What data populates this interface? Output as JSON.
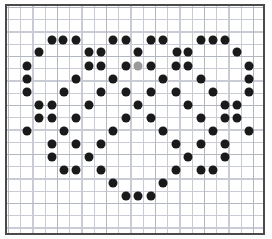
{
  "figure": {
    "title": "",
    "background_color": "#ffffff",
    "frame_color": "#4a4a4a",
    "grid_minor_color": "#c9ccd4",
    "grid_major_color": "#b3b7c0",
    "grid_spacing_px": 12.25,
    "grid_major_every": 4,
    "plot_origin": {
      "x": 5,
      "y": 4
    },
    "plot_size": {
      "width": 260,
      "height": 231
    }
  },
  "chart_data": {
    "type": "scatter",
    "title": "",
    "xlabel": "",
    "ylabel": "",
    "xlim": [
      0,
      272
    ],
    "ylim": [
      239,
      0
    ],
    "grid": true,
    "legend": null,
    "marker": "circle",
    "marker_size_px": 9,
    "colors": {
      "default": "#1a1a1a",
      "highlight": "#9a9a9a"
    },
    "annotations": [
      {
        "text": "single light-gray marker near plot center",
        "x": 138.3,
        "y": 66
      }
    ],
    "series": [
      {
        "name": "markers",
        "color": "#1a1a1a",
        "points": [
          {
            "x": 51.7,
            "y": 40,
            "c": "#1a1a1a"
          },
          {
            "x": 63.3,
            "y": 40,
            "c": "#1a1a1a"
          },
          {
            "x": 76.0,
            "y": 40,
            "c": "#1a1a1a"
          },
          {
            "x": 113.3,
            "y": 40,
            "c": "#1a1a1a"
          },
          {
            "x": 126.0,
            "y": 40,
            "c": "#1a1a1a"
          },
          {
            "x": 150.7,
            "y": 40,
            "c": "#1a1a1a"
          },
          {
            "x": 162.7,
            "y": 40,
            "c": "#1a1a1a"
          },
          {
            "x": 201.0,
            "y": 40,
            "c": "#1a1a1a"
          },
          {
            "x": 213.3,
            "y": 40,
            "c": "#1a1a1a"
          },
          {
            "x": 225.3,
            "y": 40,
            "c": "#1a1a1a"
          },
          {
            "x": 39.3,
            "y": 52,
            "c": "#1a1a1a"
          },
          {
            "x": 89.3,
            "y": 52,
            "c": "#1a1a1a"
          },
          {
            "x": 100.7,
            "y": 52,
            "c": "#1a1a1a"
          },
          {
            "x": 138.3,
            "y": 52,
            "c": "#1a1a1a"
          },
          {
            "x": 176.7,
            "y": 52,
            "c": "#1a1a1a"
          },
          {
            "x": 188.3,
            "y": 52,
            "c": "#1a1a1a"
          },
          {
            "x": 237.3,
            "y": 52,
            "c": "#1a1a1a"
          },
          {
            "x": 27.3,
            "y": 66,
            "c": "#1a1a1a"
          },
          {
            "x": 89.0,
            "y": 66,
            "c": "#1a1a1a"
          },
          {
            "x": 100.7,
            "y": 66,
            "c": "#1a1a1a"
          },
          {
            "x": 126.0,
            "y": 66,
            "c": "#1a1a1a"
          },
          {
            "x": 138.3,
            "y": 66,
            "c": "#9a9a9a"
          },
          {
            "x": 150.7,
            "y": 66,
            "c": "#1a1a1a"
          },
          {
            "x": 176.0,
            "y": 66,
            "c": "#1a1a1a"
          },
          {
            "x": 188.3,
            "y": 66,
            "c": "#1a1a1a"
          },
          {
            "x": 249.3,
            "y": 66,
            "c": "#1a1a1a"
          },
          {
            "x": 26.7,
            "y": 79,
            "c": "#1a1a1a"
          },
          {
            "x": 76.0,
            "y": 79,
            "c": "#1a1a1a"
          },
          {
            "x": 113.3,
            "y": 79,
            "c": "#1a1a1a"
          },
          {
            "x": 163.3,
            "y": 79,
            "c": "#1a1a1a"
          },
          {
            "x": 201.0,
            "y": 79,
            "c": "#1a1a1a"
          },
          {
            "x": 249.3,
            "y": 79,
            "c": "#1a1a1a"
          },
          {
            "x": 27.3,
            "y": 92,
            "c": "#1a1a1a"
          },
          {
            "x": 64.0,
            "y": 92,
            "c": "#1a1a1a"
          },
          {
            "x": 100.7,
            "y": 92,
            "c": "#1a1a1a"
          },
          {
            "x": 126.0,
            "y": 92,
            "c": "#1a1a1a"
          },
          {
            "x": 150.7,
            "y": 92,
            "c": "#1a1a1a"
          },
          {
            "x": 176.0,
            "y": 92,
            "c": "#1a1a1a"
          },
          {
            "x": 213.3,
            "y": 92,
            "c": "#1a1a1a"
          },
          {
            "x": 249.3,
            "y": 92,
            "c": "#1a1a1a"
          },
          {
            "x": 39.3,
            "y": 105,
            "c": "#1a1a1a"
          },
          {
            "x": 51.7,
            "y": 105,
            "c": "#1a1a1a"
          },
          {
            "x": 89.0,
            "y": 105,
            "c": "#1a1a1a"
          },
          {
            "x": 138.3,
            "y": 105,
            "c": "#1a1a1a"
          },
          {
            "x": 188.3,
            "y": 105,
            "c": "#1a1a1a"
          },
          {
            "x": 225.0,
            "y": 105,
            "c": "#1a1a1a"
          },
          {
            "x": 237.3,
            "y": 105,
            "c": "#1a1a1a"
          },
          {
            "x": 39.3,
            "y": 118,
            "c": "#1a1a1a"
          },
          {
            "x": 51.7,
            "y": 118,
            "c": "#1a1a1a"
          },
          {
            "x": 76.0,
            "y": 118,
            "c": "#1a1a1a"
          },
          {
            "x": 126.0,
            "y": 118,
            "c": "#1a1a1a"
          },
          {
            "x": 150.7,
            "y": 118,
            "c": "#1a1a1a"
          },
          {
            "x": 201.0,
            "y": 118,
            "c": "#1a1a1a"
          },
          {
            "x": 225.0,
            "y": 118,
            "c": "#1a1a1a"
          },
          {
            "x": 237.3,
            "y": 118,
            "c": "#1a1a1a"
          },
          {
            "x": 27.3,
            "y": 131,
            "c": "#1a1a1a"
          },
          {
            "x": 64.0,
            "y": 131,
            "c": "#1a1a1a"
          },
          {
            "x": 113.3,
            "y": 131,
            "c": "#1a1a1a"
          },
          {
            "x": 163.3,
            "y": 131,
            "c": "#1a1a1a"
          },
          {
            "x": 213.3,
            "y": 131,
            "c": "#1a1a1a"
          },
          {
            "x": 249.3,
            "y": 131,
            "c": "#1a1a1a"
          },
          {
            "x": 51.7,
            "y": 144,
            "c": "#1a1a1a"
          },
          {
            "x": 76.0,
            "y": 144,
            "c": "#1a1a1a"
          },
          {
            "x": 100.7,
            "y": 144,
            "c": "#1a1a1a"
          },
          {
            "x": 176.0,
            "y": 144,
            "c": "#1a1a1a"
          },
          {
            "x": 201.0,
            "y": 144,
            "c": "#1a1a1a"
          },
          {
            "x": 225.0,
            "y": 144,
            "c": "#1a1a1a"
          },
          {
            "x": 51.7,
            "y": 157,
            "c": "#1a1a1a"
          },
          {
            "x": 89.0,
            "y": 157,
            "c": "#1a1a1a"
          },
          {
            "x": 188.3,
            "y": 157,
            "c": "#1a1a1a"
          },
          {
            "x": 225.0,
            "y": 157,
            "c": "#1a1a1a"
          },
          {
            "x": 64.0,
            "y": 170,
            "c": "#1a1a1a"
          },
          {
            "x": 76.0,
            "y": 170,
            "c": "#1a1a1a"
          },
          {
            "x": 100.7,
            "y": 170,
            "c": "#1a1a1a"
          },
          {
            "x": 176.0,
            "y": 170,
            "c": "#1a1a1a"
          },
          {
            "x": 201.0,
            "y": 170,
            "c": "#1a1a1a"
          },
          {
            "x": 213.3,
            "y": 170,
            "c": "#1a1a1a"
          },
          {
            "x": 113.3,
            "y": 183,
            "c": "#1a1a1a"
          },
          {
            "x": 163.3,
            "y": 183,
            "c": "#1a1a1a"
          },
          {
            "x": 126.0,
            "y": 196,
            "c": "#1a1a1a"
          },
          {
            "x": 138.3,
            "y": 196,
            "c": "#1a1a1a"
          },
          {
            "x": 150.7,
            "y": 196,
            "c": "#1a1a1a"
          }
        ]
      }
    ]
  }
}
